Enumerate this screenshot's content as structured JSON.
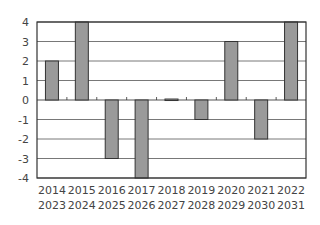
{
  "chart_data": {
    "type": "bar",
    "title": "",
    "xlabel": "",
    "ylabel": "",
    "categories": [
      [
        "2014",
        "2023"
      ],
      [
        "2015",
        "2024"
      ],
      [
        "2016",
        "2025"
      ],
      [
        "2017",
        "2026"
      ],
      [
        "2018",
        "2027"
      ],
      [
        "2019",
        "2028"
      ],
      [
        "2020",
        "2029"
      ],
      [
        "2021",
        "2030"
      ],
      [
        "2022",
        "2031"
      ]
    ],
    "values": [
      2,
      4,
      -3,
      -4,
      0.05,
      -1,
      3,
      -2,
      4
    ],
    "ylim": [
      -4,
      4
    ],
    "yticks": [
      4,
      3,
      2,
      1,
      0,
      -1,
      -2,
      -3,
      -4
    ],
    "grid": true,
    "legend": null,
    "colors": {
      "bar_fill": "#9a9a9a",
      "bar_stroke": "#333333",
      "grid": "#555555",
      "axis": "#333333"
    }
  }
}
